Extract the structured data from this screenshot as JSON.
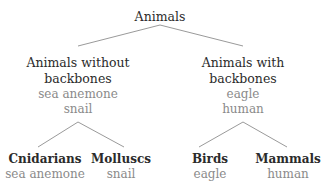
{
  "diagram": {
    "type": "tree",
    "root": {
      "label": "Animals"
    },
    "level1": [
      {
        "label_lines": [
          "Animals without",
          "backbones"
        ],
        "examples": [
          "sea anemone",
          "snail"
        ]
      },
      {
        "label_lines": [
          "Animals with",
          "backbones"
        ],
        "examples": [
          "eagle",
          "human"
        ]
      }
    ],
    "level2": [
      {
        "label": "Cnidarians",
        "examples": [
          "sea anemone"
        ],
        "parent": 0
      },
      {
        "label": "Molluscs",
        "examples": [
          "snail"
        ],
        "parent": 0
      },
      {
        "label": "Birds",
        "examples": [
          "eagle"
        ],
        "parent": 1
      },
      {
        "label": "Mammals",
        "examples": [
          "human"
        ],
        "parent": 1
      }
    ],
    "colors": {
      "title": "#2b2b2b",
      "example": "#8a8a8a",
      "line": "#9a9a9a",
      "background": "#ffffff"
    }
  }
}
